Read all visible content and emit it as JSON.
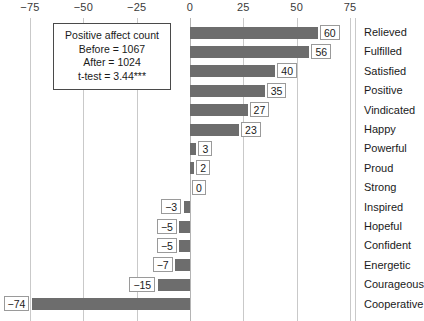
{
  "chart_data": {
    "type": "bar",
    "orientation": "horizontal",
    "title": "",
    "xlabel": "",
    "ylabel": "",
    "xlim": [
      -75,
      75
    ],
    "grid": true,
    "legend": "none",
    "xticks": [
      "−75",
      "−50",
      "−25",
      "0",
      "25",
      "50",
      "75"
    ],
    "xtick_values": [
      -75,
      -50,
      -25,
      0,
      25,
      50,
      75
    ],
    "categories": [
      "Relieved",
      "Fulfilled",
      "Satisfied",
      "Positive",
      "Vindicated",
      "Happy",
      "Powerful",
      "Proud",
      "Strong",
      "Inspired",
      "Hopeful",
      "Confident",
      "Energetic",
      "Courageous",
      "Cooperative"
    ],
    "values": [
      60,
      56,
      40,
      35,
      27,
      23,
      3,
      2,
      0,
      -3,
      -5,
      -5,
      -7,
      -15,
      -74
    ],
    "value_labels": [
      "60",
      "56",
      "40",
      "35",
      "27",
      "23",
      "3",
      "2",
      "0",
      "−3",
      "−5",
      "−5",
      "−7",
      "−15",
      "−74"
    ],
    "bar_color": "#6d6d6d",
    "gridline_color": "#c9c9c9",
    "label_box_border": "#9a9a9a"
  },
  "annotation": {
    "line1": "Positive affect count",
    "line2": "Before = 1067",
    "line3": "After = 1024",
    "line4": "t-test = 3.44***"
  }
}
